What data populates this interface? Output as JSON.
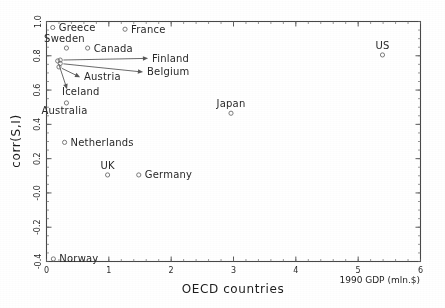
{
  "chart_data": {
    "type": "scatter",
    "title": "",
    "xlabel": "OECD countries",
    "ylabel": "corr(S,I)",
    "x_unit_note": "1990 GDP (mln.$)",
    "xlim": [
      0,
      6
    ],
    "ylim": [
      -0.4,
      1.0
    ],
    "xticks": [
      "0",
      "1",
      "2",
      "3",
      "4",
      "5",
      "6"
    ],
    "yticks": [
      "1.0",
      "0.8",
      "0.6",
      "0.4",
      "0.2",
      "-0.0",
      "-0.2",
      "-0.4"
    ],
    "xtick_values": [
      0,
      1,
      2,
      3,
      4,
      5,
      6
    ],
    "ytick_values": [
      1.0,
      0.8,
      0.6,
      0.4,
      0.2,
      0.0,
      -0.2,
      -0.4
    ],
    "grid": false,
    "legend": "none",
    "marker_style": "open-circle",
    "points": [
      {
        "name": "Greece",
        "x": 0.1,
        "y": 0.965,
        "label_dx": 6,
        "label_dy": 3.5,
        "anchor": "start",
        "leader": false
      },
      {
        "name": "France",
        "x": 1.26,
        "y": 0.955,
        "label_dx": 6,
        "label_dy": 3.5,
        "anchor": "start",
        "leader": false
      },
      {
        "name": "Sweden",
        "x": 0.32,
        "y": 0.845,
        "label_dx": -2,
        "label_dy": -6,
        "anchor": "middle",
        "leader": false
      },
      {
        "name": "Canada",
        "x": 0.66,
        "y": 0.845,
        "label_dx": 6,
        "label_dy": 3.5,
        "anchor": "start",
        "leader": false
      },
      {
        "name": "US",
        "x": 5.39,
        "y": 0.805,
        "label_dx": 0,
        "label_dy": -6,
        "anchor": "middle",
        "leader": false
      },
      {
        "name": "Japan",
        "x": 2.96,
        "y": 0.465,
        "label_dx": 0,
        "label_dy": -6,
        "anchor": "middle",
        "leader": false
      },
      {
        "name": "Australia",
        "x": 0.32,
        "y": 0.525,
        "label_dx": -2,
        "label_dy": 11,
        "anchor": "middle",
        "leader": false
      },
      {
        "name": "Netherlands",
        "x": 0.29,
        "y": 0.295,
        "label_dx": 6,
        "label_dy": 3.5,
        "anchor": "start",
        "leader": false
      },
      {
        "name": "UK",
        "x": 0.98,
        "y": 0.105,
        "label_dx": 0,
        "label_dy": -6,
        "anchor": "middle",
        "leader": false
      },
      {
        "name": "Germany",
        "x": 1.48,
        "y": 0.105,
        "label_dx": 6,
        "label_dy": 3.5,
        "anchor": "start",
        "leader": false
      },
      {
        "name": "Norway",
        "x": 0.11,
        "y": -0.385,
        "label_dx": 6,
        "label_dy": 3.5,
        "anchor": "start",
        "leader": false
      },
      {
        "name": "Finland",
        "x": 0.22,
        "y": 0.775,
        "label_dx": 0,
        "label_dy": 0,
        "anchor": "start",
        "leader": true,
        "leader_tip_x": 1.63,
        "leader_tip_y": 0.785,
        "label_px_x": 152,
        "label_px_y": 62
      },
      {
        "name": "Belgium",
        "x": 0.22,
        "y": 0.755,
        "label_dx": 0,
        "label_dy": 0,
        "anchor": "start",
        "leader": true,
        "leader_tip_x": 1.55,
        "leader_tip_y": 0.705,
        "label_px_x": 147,
        "label_px_y": 75
      },
      {
        "name": "Austria",
        "x": 0.2,
        "y": 0.735,
        "label_dx": 0,
        "label_dy": 0,
        "anchor": "start",
        "leader": true,
        "leader_tip_x": 0.54,
        "leader_tip_y": 0.675,
        "label_px_x": 84,
        "label_px_y": 80
      },
      {
        "name": "Iceland",
        "x": 0.18,
        "y": 0.77,
        "label_dx": 0,
        "label_dy": 0,
        "anchor": "start",
        "leader": true,
        "leader_tip_x": 0.33,
        "leader_tip_y": 0.605,
        "label_px_x": 62,
        "label_px_y": 95
      }
    ]
  },
  "axes": {
    "x_title": "OECD countries",
    "y_title": "corr(S,I)",
    "x_unit_note": "1990 GDP (mln.$)"
  }
}
